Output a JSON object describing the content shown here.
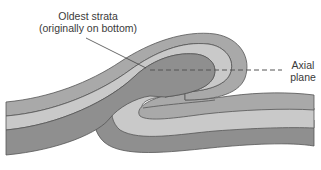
{
  "diagram": {
    "type": "recumbent-fold-cross-section",
    "labels": {
      "oldest_line1": "Oldest strata",
      "oldest_line2": "(originally on bottom)",
      "axial_line1": "Axial",
      "axial_line2": "plane"
    },
    "layers": [
      {
        "name": "outer-layer",
        "color": "#a9a9a9"
      },
      {
        "name": "middle-layer",
        "color": "#c9c9c9"
      },
      {
        "name": "oldest-layer",
        "color": "#8f8f8f"
      }
    ],
    "stroke_color": "#555555",
    "axial_plane_style": "dashed"
  }
}
